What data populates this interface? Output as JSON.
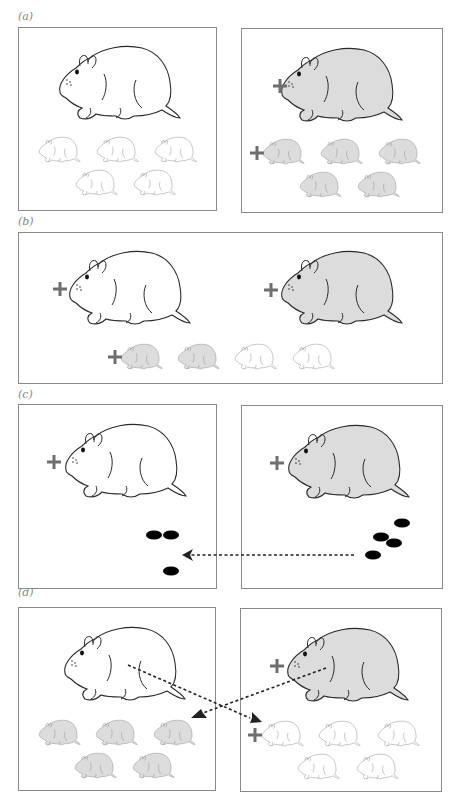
{
  "figure": {
    "colors": {
      "outline": "#2a2a2a",
      "light_outline": "#8a8a8a",
      "shaded_fill": "#dcdcdc",
      "unshaded_fill": "#ffffff",
      "plus_marker": "#6e6e6e",
      "box_border": "#8a8a8a",
      "pellet": "#000000",
      "arrow": "#222222"
    },
    "panels": [
      {
        "label": "(a)",
        "description": "Two boxes: left unshaded adult with 5 unshaded pups; right shaded adult (marked +) with 5 shaded pups (first pup marked +)"
      },
      {
        "label": "(b)",
        "description": "One box: unshaded adult (marked +) and shaded adult (marked +); 4 pups below: 2 shaded (first marked +) and 2 unshaded"
      },
      {
        "label": "(c)",
        "description": "Two boxes: unshaded adult (marked +) and shaded adult (marked +); black pellets transferred from right box to left box via dashed arrow"
      },
      {
        "label": "(d)",
        "description": "Two boxes: unshaded adult with 5 shaded pups; shaded adult (marked +) with 5 unshaded pups (first marked +); crossed dashed arrows indicate cross-fostering"
      }
    ]
  }
}
